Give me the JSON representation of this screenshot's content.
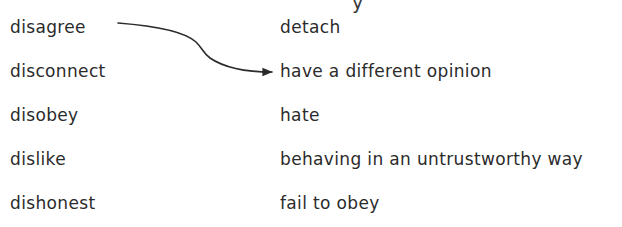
{
  "page": {
    "background_color": "#ffffff",
    "text_color": "#2b2b2b",
    "ink_color": "#2b2b2b",
    "clipped_descender_above": "y"
  },
  "left_column": {
    "name": "prefix-words",
    "items": [
      {
        "label": "disagree"
      },
      {
        "label": "disconnect"
      },
      {
        "label": "disobey"
      },
      {
        "label": "dislike"
      },
      {
        "label": "dishonest"
      }
    ]
  },
  "right_column": {
    "name": "definitions",
    "items": [
      {
        "label": "detach"
      },
      {
        "label": "have a different opinion"
      },
      {
        "label": "hate"
      },
      {
        "label": "behaving in an untrustworthy way"
      },
      {
        "label": "fail to obey"
      }
    ]
  },
  "connectors": [
    {
      "name": "disagree-to-have-a-different-opinion",
      "from_item": "disagree",
      "to_item": "have a different opinion",
      "style": "curved-arrow",
      "color": "#2b2b2b",
      "stroke_width": 1.6,
      "start": {
        "x": 118,
        "y": 23
      },
      "end": {
        "x": 278,
        "y": 72
      },
      "arrowhead": "solid-triangle"
    }
  ]
}
